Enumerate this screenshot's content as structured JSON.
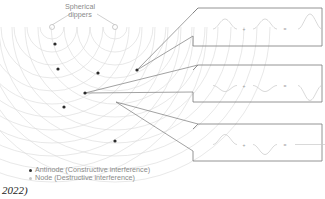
{
  "diagram": {
    "source_label": {
      "line1": "Spherical",
      "line2": "dippers"
    },
    "legend": {
      "antinode": "Antinode (Constructive interference)",
      "node": "Node (Destructive interference)"
    },
    "caption": "2022)",
    "antinode_points": [
      [
        55,
        44
      ],
      [
        58,
        69
      ],
      [
        98,
        73
      ],
      [
        137,
        70
      ],
      [
        85,
        93
      ],
      [
        64,
        107
      ],
      [
        115,
        141
      ]
    ],
    "callouts": [
      {
        "name": "constructive-crest",
        "box": {
          "x": 193,
          "y": 8,
          "w": 129,
          "h": 38
        },
        "wave": "crest",
        "from": [
          137,
          70
        ]
      },
      {
        "name": "constructive-trough",
        "box": {
          "x": 193,
          "y": 65,
          "w": 129,
          "h": 37
        },
        "wave": "trough",
        "from": [
          85,
          93
        ]
      },
      {
        "name": "destructive-flat",
        "box": {
          "x": 193,
          "y": 124,
          "w": 129,
          "h": 37
        },
        "wave": "flat",
        "from": [
          116,
          102
        ]
      }
    ],
    "colors": {
      "line": "#7a7a7a",
      "pattern": "#d9d9d9",
      "dot": "#2b2b2b",
      "wave": "#c9c9c9"
    }
  }
}
